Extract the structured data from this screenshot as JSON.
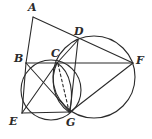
{
  "figure": {
    "canvas": {
      "width": 152,
      "height": 139
    },
    "stroke_color": "#2b2b2b",
    "background_color": "#ffffff",
    "stroke_width": 1.1,
    "points": [
      {
        "id": "A",
        "label": "A",
        "x": 33,
        "y": 17,
        "label_x": 28,
        "label_y": 2,
        "on_circle": false
      },
      {
        "id": "B",
        "label": "B",
        "x": 26,
        "y": 63,
        "label_x": 14,
        "label_y": 53,
        "on_circle": true
      },
      {
        "id": "C",
        "label": "C",
        "x": 57,
        "y": 63,
        "label_x": 51,
        "label_y": 48,
        "on_circle": true
      },
      {
        "id": "D",
        "label": "D",
        "x": 78,
        "y": 40,
        "label_x": 74,
        "label_y": 26,
        "on_circle": true
      },
      {
        "id": "E",
        "label": "E",
        "x": 22,
        "y": 113,
        "label_x": 9,
        "label_y": 116,
        "on_circle": true
      },
      {
        "id": "F",
        "label": "F",
        "x": 133,
        "y": 63,
        "label_x": 136,
        "label_y": 55,
        "on_circle": true
      },
      {
        "id": "G",
        "label": "G",
        "x": 70,
        "y": 112,
        "label_x": 66,
        "label_y": 117,
        "on_circle": true
      }
    ],
    "circles": [
      {
        "id": "left-circle",
        "name": "circle-through-B-E-G-C",
        "cx": 51,
        "cy": 90,
        "r": 30
      },
      {
        "id": "right-circle",
        "name": "circle-through-D-F-G",
        "cx": 94,
        "cy": 77,
        "r": 41
      }
    ],
    "segments": [
      {
        "id": "AB",
        "from": "A",
        "to": "B",
        "style": "solid"
      },
      {
        "id": "AF",
        "from": "A",
        "to": "F",
        "style": "solid",
        "note": "passes through D"
      },
      {
        "id": "BF",
        "from": "B",
        "to": "F",
        "style": "solid",
        "note": "passes through C"
      },
      {
        "id": "BE",
        "from": "B",
        "to": "E",
        "style": "solid"
      },
      {
        "id": "BG",
        "from": "B",
        "to": "G",
        "style": "solid"
      },
      {
        "id": "CE",
        "from": "C",
        "to": "E",
        "style": "solid"
      },
      {
        "id": "CD",
        "from": "C",
        "to": "D",
        "style": "solid"
      },
      {
        "id": "DG",
        "from": "D",
        "to": "G",
        "style": "solid"
      },
      {
        "id": "EG",
        "from": "E",
        "to": "G",
        "style": "solid"
      },
      {
        "id": "GF",
        "from": "G",
        "to": "F",
        "style": "solid"
      },
      {
        "id": "CG",
        "from": "C",
        "to": "G",
        "style": "dashed"
      }
    ],
    "lens_arcs": [
      {
        "id": "lens-left-arc",
        "from": "C",
        "to": "G",
        "bulge": "left"
      },
      {
        "id": "lens-right-arc",
        "from": "C",
        "to": "G",
        "bulge": "right"
      }
    ]
  }
}
